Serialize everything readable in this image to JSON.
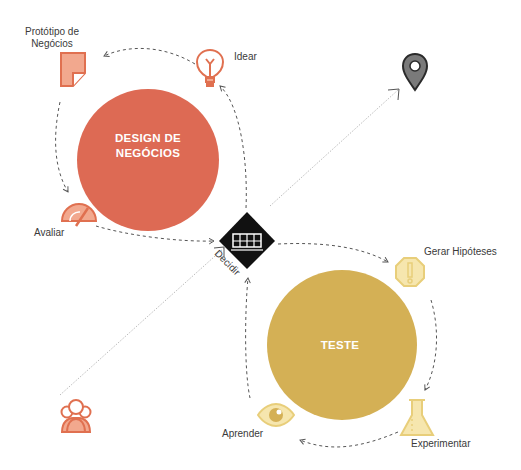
{
  "colors": {
    "business_design": "#DD6A54",
    "business_icon": "#E07050",
    "business_icon_fill": "#F2A88E",
    "test": "#D4B055",
    "test_icon": "#E8CE7A",
    "test_icon_fill": "#F6E6AE",
    "decide": "#111111",
    "pin": "#2a2a2a",
    "pin_fill": "#7a7a7a"
  },
  "circles": {
    "business_design": {
      "label_line1": "DESIGN DE",
      "label_line2": "NEGÓCIOS"
    },
    "test": {
      "label": "TESTE"
    }
  },
  "steps": {
    "prototype": {
      "label_line1": "Protótipo de",
      "label_line2": "Negócios",
      "icon": "prototype-sheet-icon"
    },
    "ideate": {
      "label": "Idear",
      "icon": "lightbulb-icon"
    },
    "assess": {
      "label": "Avaliar",
      "icon": "gauge-icon"
    },
    "decide": {
      "label": "Decidir",
      "icon": "decision-grid-icon"
    },
    "hypothesize": {
      "label": "Gerar Hipóteses",
      "icon": "warning-octagon-icon"
    },
    "experiment": {
      "label": "Experimentar",
      "icon": "flask-icon"
    },
    "learn": {
      "label": "Aprender",
      "icon": "eye-icon"
    }
  },
  "endpoints": {
    "start": {
      "icon": "team-icon"
    },
    "goal": {
      "icon": "location-pin-icon"
    }
  }
}
